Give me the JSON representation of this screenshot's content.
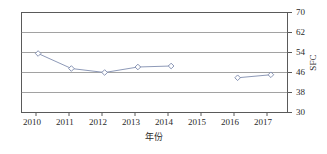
{
  "chart_data": {
    "type": "line",
    "title": "",
    "xlabel": "年份",
    "ylabel": "SFC",
    "x": [
      2010,
      2011,
      2012,
      2013,
      2014,
      2015,
      2016,
      2017
    ],
    "xtick_labels": [
      "2010",
      "2011",
      "2012",
      "2013",
      "2014",
      "2015",
      "2016",
      "2017"
    ],
    "ytick_labels": [
      "30",
      "38",
      "46",
      "54",
      "62",
      "70"
    ],
    "yticks": [
      30,
      38,
      46,
      54,
      62,
      70
    ],
    "ylim": [
      30,
      70
    ],
    "xlim": [
      2009.5,
      2017.5
    ],
    "grid": "horizontal",
    "legend": "none",
    "yaxis_position": "right",
    "series": [
      {
        "name": "SFC",
        "marker": "diamond-open",
        "line_color": "#8e9ab8",
        "marker_color": "#ffffff",
        "marker_edge_color": "#7b88ab",
        "points": [
          {
            "x": 2010,
            "y": 53.6
          },
          {
            "x": 2011,
            "y": 47.6
          },
          {
            "x": 2012,
            "y": 46.0
          },
          {
            "x": 2013,
            "y": 48.2
          },
          {
            "x": 2014,
            "y": 48.6
          },
          {
            "x": 2015,
            "y": null
          },
          {
            "x": 2016,
            "y": 43.9
          },
          {
            "x": 2017,
            "y": 45.1
          }
        ]
      }
    ]
  },
  "axes": {
    "y_label_text": "SFC",
    "x_label_text": "年份"
  }
}
